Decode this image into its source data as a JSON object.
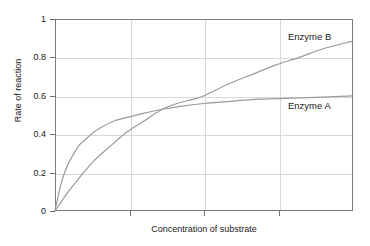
{
  "chart_data": {
    "type": "line",
    "title": "",
    "xlabel": "Concentration of substrate",
    "ylabel": "Rate of reaction",
    "xlim": [
      0,
      1
    ],
    "ylim": [
      0,
      1
    ],
    "grid": true,
    "legend_position": "inline-annotation",
    "y_ticks": [
      "0",
      "0.2",
      "0.4",
      "0.6",
      "0.8",
      "1"
    ],
    "y_tick_values": [
      0,
      0.2,
      0.4,
      0.6,
      0.8,
      1
    ],
    "x_ticks": [
      "",
      "",
      "",
      "",
      ""
    ],
    "x_tick_values": [
      0,
      0.25,
      0.5,
      0.75,
      1
    ],
    "x_axis_tick_labels_shown": false,
    "annotations": [
      {
        "text": "Enzyme B",
        "x": 0.78,
        "y": 0.93
      },
      {
        "text": "Enzyme A",
        "x": 0.78,
        "y": 0.57
      }
    ],
    "series": [
      {
        "name": "Enzyme A",
        "label": "Enzyme A",
        "color": "#9a9a9a",
        "vmax": 0.63,
        "km": 0.07,
        "end_value": 0.6,
        "x": [
          0,
          0.02,
          0.04,
          0.06,
          0.08,
          0.1,
          0.13,
          0.16,
          0.2,
          0.25,
          0.3,
          0.36,
          0.42,
          0.5,
          0.58,
          0.66,
          0.75,
          0.85,
          1.0
        ],
        "values": [
          0,
          0.14,
          0.23,
          0.29,
          0.34,
          0.37,
          0.41,
          0.44,
          0.47,
          0.49,
          0.51,
          0.53,
          0.545,
          0.56,
          0.57,
          0.58,
          0.585,
          0.59,
          0.6
        ]
      },
      {
        "name": "Enzyme B",
        "label": "Enzyme B",
        "color": "#9a9a9a",
        "vmax": 1.45,
        "km": 0.62,
        "end_value": 0.885,
        "x": [
          0,
          0.04,
          0.08,
          0.13,
          0.18,
          0.24,
          0.3,
          0.36,
          0.42,
          0.46,
          0.5,
          0.58,
          0.66,
          0.74,
          0.82,
          0.9,
          1.0
        ],
        "values": [
          0,
          0.09,
          0.17,
          0.26,
          0.33,
          0.41,
          0.47,
          0.53,
          0.565,
          0.58,
          0.6,
          0.66,
          0.71,
          0.76,
          0.8,
          0.845,
          0.885
        ]
      }
    ],
    "crossing_point": {
      "x": 0.46,
      "y": 0.58
    },
    "colors": {
      "curve": "#9a9a9a",
      "axis": "#7d7d7d",
      "grid": "#d8d8d8",
      "text": "#1a1a1a",
      "background": "#ffffff"
    }
  }
}
